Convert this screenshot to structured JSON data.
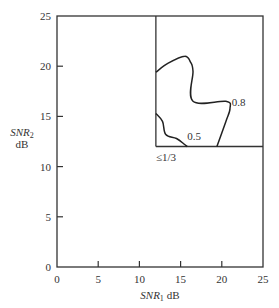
{
  "chart_data": {
    "type": "line",
    "title": "",
    "xlabel": "SNR1 dB",
    "xlabel_main": "SNR",
    "xlabel_sub": "1",
    "xlabel_unit": "dB",
    "ylabel": "SNR2 dB",
    "ylabel_main": "SNR",
    "ylabel_sub": "2",
    "ylabel_unit": "dB",
    "xlim": [
      0,
      25
    ],
    "ylim": [
      0,
      25
    ],
    "xticks": [
      0,
      5,
      10,
      15,
      20,
      25
    ],
    "yticks": [
      0,
      5,
      10,
      15,
      20,
      25
    ],
    "grid": false,
    "legend": null,
    "region_boundary": {
      "description": "Quadrant bounded by SNR1 = 12 dB and SNR2 = 12 dB",
      "x": 12,
      "y": 12
    },
    "series": [
      {
        "name": "0.8",
        "label": "0.8",
        "points": [
          [
            12,
            19.4
          ],
          [
            13.5,
            20.3
          ],
          [
            15.5,
            21.0
          ],
          [
            16.2,
            20.4
          ],
          [
            16.5,
            19.5
          ],
          [
            16.5,
            16.5
          ],
          [
            20.5,
            16.5
          ],
          [
            21.0,
            15.8
          ],
          [
            20.5,
            14.5
          ],
          [
            19.4,
            12.0
          ]
        ]
      },
      {
        "name": "0.5",
        "label": "0.5",
        "points": [
          [
            12,
            15.3
          ],
          [
            12.8,
            14.5
          ],
          [
            13.2,
            13.2
          ],
          [
            14.5,
            12.8
          ],
          [
            15.5,
            12.2
          ],
          [
            15.8,
            12.0
          ]
        ]
      }
    ],
    "annotations": [
      {
        "text": "0.8",
        "x": 21.2,
        "y": 16.4
      },
      {
        "text": "0.5",
        "x": 15.8,
        "y": 13.0
      },
      {
        "text": "≤1/3",
        "x": 12.0,
        "y": 11.0
      }
    ]
  }
}
